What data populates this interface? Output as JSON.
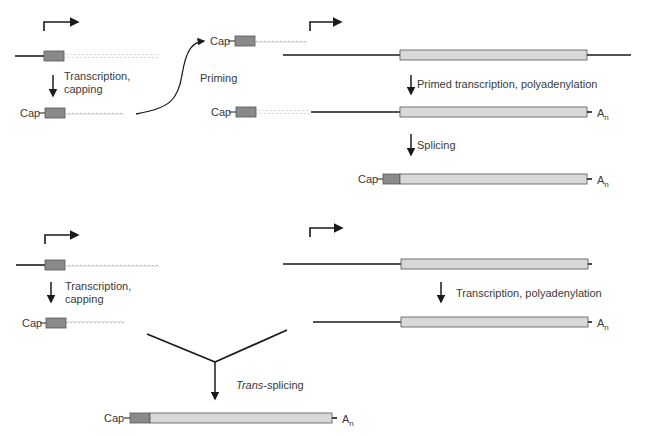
{
  "diagram": {
    "top_panel": {
      "left": {
        "step_label_line1": "Transcription,",
        "step_label_line2": "capping",
        "cap_label": "Cap"
      },
      "middle": {
        "cap_label": "Cap",
        "priming_label": "Priming",
        "cap_label_2": "Cap"
      },
      "right": {
        "step1_label": "Primed transcription, polyadenylation",
        "step2_label": "Splicing",
        "polyA_label_1": "A",
        "polyA_sub_1": "n",
        "polyA_label_2": "A",
        "polyA_sub_2": "n",
        "final_cap_label": "Cap"
      }
    },
    "bottom_panel": {
      "left": {
        "step_label_line1": "Transcription,",
        "step_label_line2": "capping",
        "cap_label": "Cap"
      },
      "right": {
        "step_label": "Transcription, polyadenylation",
        "polyA_label": "A",
        "polyA_sub": "n"
      },
      "merge": {
        "step_label_italic": "Trans",
        "step_label_rest": "-splicing",
        "cap_label": "Cap",
        "polyA_label": "A",
        "polyA_sub": "n"
      }
    },
    "colors": {
      "line": "#1a1a1a",
      "dark_box": "#8a8a8a",
      "light_box": "#d9d9d9",
      "wavy": "#9a9a9a",
      "text": "#3a3a3a"
    }
  }
}
